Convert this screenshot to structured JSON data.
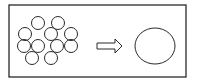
{
  "diagram": {
    "colors": {
      "stroke": "#2a2a2a",
      "background": "#ffffff"
    },
    "frame": {
      "x": 9,
      "y": 5,
      "width": 177,
      "height": 72
    },
    "small_circles": [
      {
        "cx": 38,
        "cy": 23,
        "r": 6.5
      },
      {
        "cx": 58,
        "cy": 23,
        "r": 6.5
      },
      {
        "cx": 25,
        "cy": 34,
        "r": 6.5
      },
      {
        "cx": 51,
        "cy": 34,
        "r": 6.5
      },
      {
        "cx": 71,
        "cy": 34,
        "r": 6.5
      },
      {
        "cx": 24,
        "cy": 46,
        "r": 6.5
      },
      {
        "cx": 38,
        "cy": 46,
        "r": 6.5
      },
      {
        "cx": 57,
        "cy": 46,
        "r": 6.5
      },
      {
        "cx": 71,
        "cy": 46,
        "r": 6.5
      },
      {
        "cx": 32,
        "cy": 58,
        "r": 6.5
      },
      {
        "cx": 51,
        "cy": 58,
        "r": 6.5
      }
    ],
    "arrow": {
      "icon": "hollow-right-arrow-icon",
      "x1": 97,
      "x2": 122,
      "y": 46
    },
    "large_circle": {
      "cx": 155,
      "cy": 46,
      "rx": 20,
      "ry": 18
    }
  }
}
